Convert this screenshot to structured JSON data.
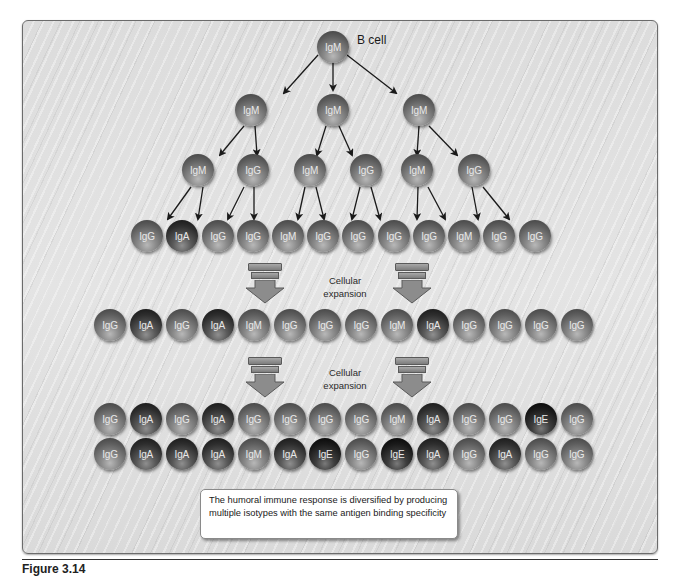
{
  "figure": {
    "caption": "Figure 3.14",
    "b_cell_label": "B cell",
    "expansion_label_line1": "Cellular",
    "expansion_label_line2": "expansion",
    "note": "The humoral immune response is diversified by producing multiple isotypes with the same antigen binding specificity"
  },
  "colors": {
    "panel_bg": "#dedede",
    "panel_border": "#6b6b6b",
    "arrow": "#1a1a1a",
    "fat_arrow": "#8c8c8c",
    "cell_text": "#e8e8e8"
  },
  "rows": [
    {
      "id": "root",
      "y": 47,
      "cells": [
        {
          "x": 333,
          "label": "IgM"
        }
      ]
    },
    {
      "id": "gen1",
      "y": 110,
      "cells": [
        {
          "x": 251,
          "label": "IgM"
        },
        {
          "x": 333,
          "label": "IgM"
        },
        {
          "x": 419,
          "label": "IgM"
        }
      ]
    },
    {
      "id": "gen2",
      "y": 170,
      "cells": [
        {
          "x": 198,
          "label": "IgM"
        },
        {
          "x": 253,
          "label": "IgG"
        },
        {
          "x": 310,
          "label": "IgM"
        },
        {
          "x": 366,
          "label": "IgG"
        },
        {
          "x": 417,
          "label": "IgM"
        },
        {
          "x": 474,
          "label": "IgG"
        }
      ]
    },
    {
      "id": "gen3",
      "y": 236,
      "cells": [
        {
          "x": 147,
          "label": "IgG"
        },
        {
          "x": 182,
          "label": "IgA"
        },
        {
          "x": 218,
          "label": "IgG"
        },
        {
          "x": 253,
          "label": "IgG"
        },
        {
          "x": 288,
          "label": "IgM"
        },
        {
          "x": 323,
          "label": "IgG"
        },
        {
          "x": 358,
          "label": "IgG"
        },
        {
          "x": 394,
          "label": "IgG"
        },
        {
          "x": 429,
          "label": "IgG"
        },
        {
          "x": 464,
          "label": "IgM"
        },
        {
          "x": 499,
          "label": "IgG"
        },
        {
          "x": 535,
          "label": "IgG"
        }
      ]
    },
    {
      "id": "expansion1",
      "y": 325,
      "labels": [
        "IgG",
        "IgA",
        "IgG",
        "IgA",
        "IgM",
        "IgG",
        "IgG",
        "IgG",
        "IgM",
        "IgA",
        "IgG",
        "IgG",
        "IgG",
        "IgG"
      ]
    },
    {
      "id": "expansion2_top",
      "y": 419,
      "labels": [
        "IgG",
        "IgA",
        "IgG",
        "IgA",
        "IgG",
        "IgG",
        "IgG",
        "IgG",
        "IgM",
        "IgA",
        "IgG",
        "IgG",
        "IgE",
        "IgG"
      ]
    },
    {
      "id": "expansion2_bottom",
      "y": 454,
      "labels": [
        "IgG",
        "IgA",
        "IgA",
        "IgA",
        "IgM",
        "IgA",
        "IgE",
        "IgG",
        "IgE",
        "IgA",
        "IgG",
        "IgA",
        "IgG",
        "IgG"
      ]
    }
  ],
  "wide_row_x_start": 110,
  "wide_row_x_step": 35.9,
  "arrows": [
    [
      318,
      55,
      284,
      93
    ],
    [
      333,
      61,
      333,
      90
    ],
    [
      347,
      55,
      396,
      93
    ],
    [
      244,
      126,
      220,
      155
    ],
    [
      255,
      126,
      257,
      155
    ],
    [
      326,
      126,
      317,
      155
    ],
    [
      339,
      126,
      352,
      155
    ],
    [
      419,
      126,
      417,
      155
    ],
    [
      429,
      126,
      457,
      155
    ],
    [
      191,
      187,
      168,
      219
    ],
    [
      203,
      187,
      198,
      219
    ],
    [
      244,
      187,
      228,
      219
    ],
    [
      254,
      187,
      254,
      219
    ],
    [
      305,
      187,
      298,
      219
    ],
    [
      316,
      187,
      324,
      219
    ],
    [
      360,
      187,
      352,
      219
    ],
    [
      371,
      187,
      380,
      219
    ],
    [
      418,
      187,
      417,
      219
    ],
    [
      428,
      187,
      445,
      219
    ],
    [
      472,
      187,
      478,
      219
    ],
    [
      483,
      187,
      509,
      219
    ]
  ],
  "fat_arrows": [
    {
      "x": 265,
      "y": 263
    },
    {
      "x": 412,
      "y": 263
    },
    {
      "x": 265,
      "y": 357
    },
    {
      "x": 412,
      "y": 357
    }
  ],
  "expansion_labels": [
    {
      "x": 345,
      "y": 274
    },
    {
      "x": 345,
      "y": 366
    }
  ]
}
